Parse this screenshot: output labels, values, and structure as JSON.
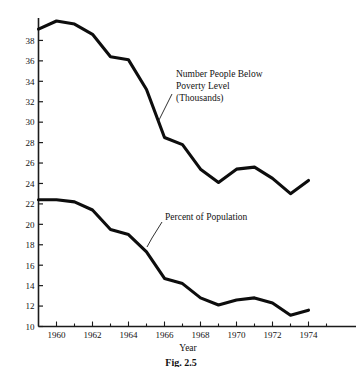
{
  "chart_data": {
    "type": "line",
    "title": "",
    "caption": "Fig. 2.5",
    "xlabel": "Year",
    "ylabel": "",
    "xlim": [
      1959,
      1975
    ],
    "ylim": [
      10,
      40
    ],
    "grid": false,
    "legend_position": "inline-annotations",
    "xticks": [
      1960,
      1962,
      1964,
      1966,
      1968,
      1970,
      1972,
      1974
    ],
    "xtick_labels": [
      "1960",
      "1962",
      "1964",
      "1966",
      "1968",
      "1970",
      "1972",
      "1974"
    ],
    "yticks": [
      10,
      12,
      14,
      16,
      18,
      20,
      22,
      24,
      26,
      28,
      30,
      32,
      34,
      36,
      38
    ],
    "ytick_labels": [
      "10",
      "12",
      "14",
      "16",
      "18",
      "20",
      "22",
      "24",
      "26",
      "28",
      "30",
      "32",
      "34",
      "36",
      "38"
    ],
    "x": [
      1959,
      1960,
      1961,
      1962,
      1963,
      1964,
      1965,
      1966,
      1967,
      1968,
      1969,
      1970,
      1971,
      1972,
      1973,
      1974
    ],
    "series": [
      {
        "name": "Number People Below Poverty Level (Thousands)",
        "annotation_lines": [
          "Number People Below",
          "Poverty Level",
          "(Thousands)"
        ],
        "values": [
          39.1,
          39.9,
          39.6,
          38.6,
          36.4,
          36.1,
          33.2,
          28.5,
          27.8,
          25.4,
          24.1,
          25.4,
          25.6,
          24.5,
          23.0,
          24.3
        ]
      },
      {
        "name": "Percent of Population",
        "annotation_lines": [
          "Percent of Population"
        ],
        "values": [
          22.4,
          22.4,
          22.2,
          21.4,
          19.5,
          19.0,
          17.3,
          14.7,
          14.2,
          12.8,
          12.1,
          12.6,
          12.8,
          12.3,
          11.1,
          11.6
        ]
      }
    ]
  },
  "colors": {
    "ink": "#101010",
    "axis": "#2a2a2a",
    "background": "#ffffff"
  }
}
